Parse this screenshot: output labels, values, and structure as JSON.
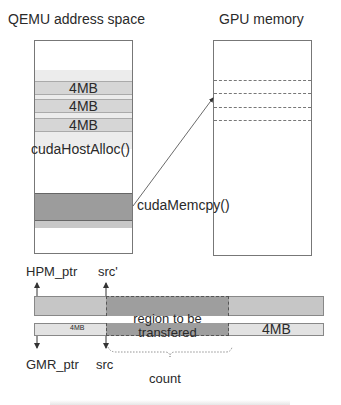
{
  "qemu": {
    "title": "QEMU address space",
    "blocks": [
      "4MB",
      "4MB",
      "4MB"
    ],
    "alloc_label": "cudaHostAlloc()"
  },
  "gpu": {
    "title": "GPU memory",
    "copy_label": "cudaMemcpy()"
  },
  "transfer": {
    "hpm_ptr": "HPM_ptr",
    "src_prime": "src'",
    "gmr_ptr": "GMR_ptr",
    "src": "src",
    "left_block": "4MB",
    "right_block": "4MB",
    "region_line1": "region to be",
    "region_line2": "transfered",
    "count": "count"
  },
  "colors": {
    "light": "#ececec",
    "mid": "#d6d6d6",
    "dark": "#9c9c9c",
    "line": "#777777"
  }
}
